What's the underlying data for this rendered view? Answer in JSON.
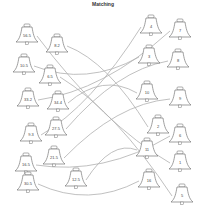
{
  "worksheet": {
    "title": "Matching",
    "line_color": "#b0b0b0",
    "bell_stroke": "#777777",
    "left_bells": [
      {
        "label": "56.5",
        "x": 27,
        "y": 36
      },
      {
        "label": "8.2",
        "x": 57,
        "y": 46
      },
      {
        "label": "10.5",
        "x": 24,
        "y": 66
      },
      {
        "label": "6.5",
        "x": 50,
        "y": 77
      },
      {
        "label": "33.2",
        "x": 28,
        "y": 100
      },
      {
        "label": "34.4",
        "x": 58,
        "y": 103
      },
      {
        "label": "9.3",
        "x": 31,
        "y": 135
      },
      {
        "label": "27.5",
        "x": 56,
        "y": 129
      },
      {
        "label": "16.5",
        "x": 26,
        "y": 165
      },
      {
        "label": "21.5",
        "x": 54,
        "y": 158
      },
      {
        "label": "30.5",
        "x": 28,
        "y": 184
      },
      {
        "label": "12.5",
        "x": 76,
        "y": 180
      }
    ],
    "right_bells": [
      {
        "label": "4",
        "x": 151,
        "y": 27
      },
      {
        "label": "7",
        "x": 180,
        "y": 31
      },
      {
        "label": "3",
        "x": 149,
        "y": 57
      },
      {
        "label": "8",
        "x": 178,
        "y": 61
      },
      {
        "label": "10",
        "x": 147,
        "y": 93
      },
      {
        "label": "9",
        "x": 180,
        "y": 99
      },
      {
        "label": "2",
        "x": 158,
        "y": 127
      },
      {
        "label": "6",
        "x": 180,
        "y": 136
      },
      {
        "label": "11",
        "x": 147,
        "y": 150
      },
      {
        "label": "1",
        "x": 180,
        "y": 163
      },
      {
        "label": "16",
        "x": 149,
        "y": 181
      },
      {
        "label": "5",
        "x": 182,
        "y": 196
      }
    ]
  }
}
